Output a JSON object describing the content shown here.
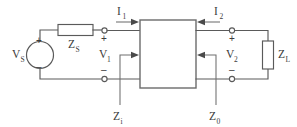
{
  "diagram": {
    "type": "circuit-schematic",
    "colors": {
      "wire": "#5a5a5a",
      "label": "#3c3c3c",
      "background": "#ffffff"
    },
    "source": {
      "label_base": "V",
      "label_sub": "S",
      "plus_sign": "+",
      "minus_sign": "–"
    },
    "series_impedance": {
      "label_base": "Z",
      "label_sub": "S"
    },
    "load_impedance": {
      "label_base": "Z",
      "label_sub": "L"
    },
    "port1_voltage": {
      "label_base": "V",
      "label_sub": "1",
      "plus_sign": "+",
      "minus_sign": "–"
    },
    "port2_voltage": {
      "label_base": "V",
      "label_sub": "2",
      "plus_sign": "+",
      "minus_sign": "–"
    },
    "current1": {
      "label_base": "I",
      "label_sub": "1"
    },
    "current2": {
      "label_base": "I",
      "label_sub": "2"
    },
    "input_impedance": {
      "label_base": "Z",
      "label_sub": "i"
    },
    "output_impedance": {
      "label_base": "Z",
      "label_sub": "0"
    },
    "network_block": {
      "label": ""
    }
  }
}
